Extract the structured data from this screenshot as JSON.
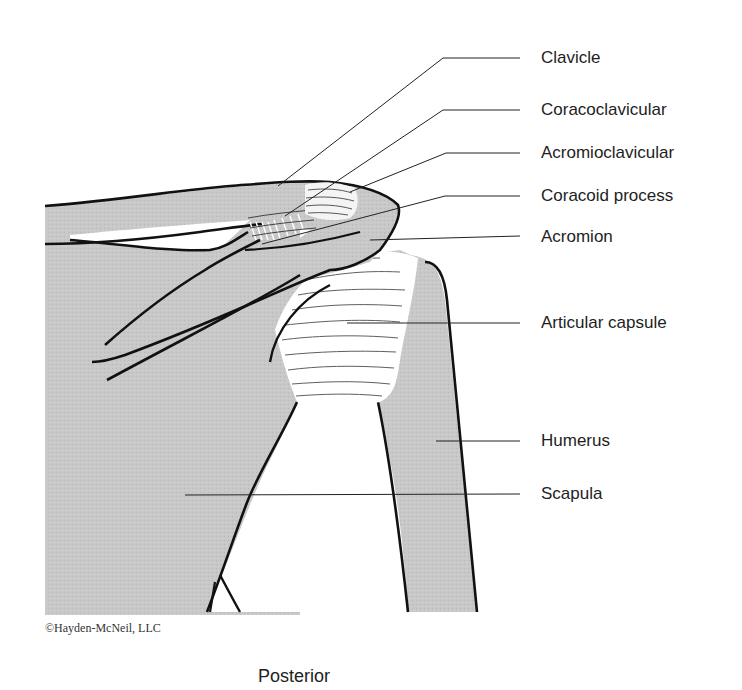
{
  "figure": {
    "view": "Posterior",
    "copyright": "©Hayden-McNeil, LLC",
    "colors": {
      "bone": "#c9c9c9",
      "ligament": "#ffffff",
      "outline": "#111111",
      "leader": "#222222"
    }
  },
  "labels": [
    {
      "id": "clavicle",
      "text": "Clavicle"
    },
    {
      "id": "coracoclavicular",
      "text": "Coracoclavicular"
    },
    {
      "id": "acromioclavicular",
      "text": "Acromioclavicular"
    },
    {
      "id": "coracoid-process",
      "text": "Coracoid process"
    },
    {
      "id": "acromion",
      "text": "Acromion"
    },
    {
      "id": "articular-capsule",
      "text": "Articular capsule"
    },
    {
      "id": "humerus",
      "text": "Humerus"
    },
    {
      "id": "scapula",
      "text": "Scapula"
    }
  ]
}
